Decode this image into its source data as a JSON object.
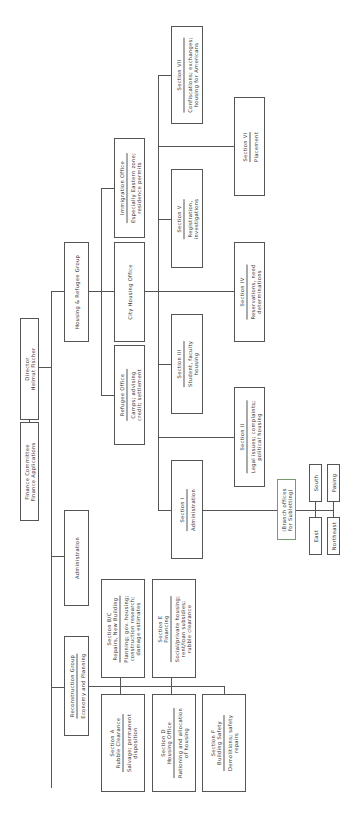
{
  "diagram": {
    "type": "org-chart",
    "orientation": "rotated-90-ccw",
    "nodes": {
      "director": {
        "title": "Director",
        "subtitle": "Helmut Fischer"
      },
      "finance": {
        "title": "Finance Committee",
        "subtitle": "Finance Applications"
      },
      "housing_group": {
        "title": "Housing & Refugee Group"
      },
      "administration": {
        "title": "Administration"
      },
      "reconstruction": {
        "title": "Reconstruction Group",
        "subtitle": "Economy and Planning"
      },
      "immigration": {
        "title": "Immigration Office",
        "desc1": "Especially Eastern zone;",
        "desc2": "residence permits"
      },
      "city_housing": {
        "title": "City Housing Office"
      },
      "refugee": {
        "title": "Refugee Office",
        "desc1": "Camps; advising",
        "desc2": "credit; settlement"
      },
      "sec7": {
        "title": "Section VII",
        "desc1": "Confiscations; exchanges;",
        "desc2": "housing for Americans"
      },
      "sec6": {
        "title": "Section VI",
        "desc1": "Placement"
      },
      "sec5": {
        "title": "Section V",
        "desc1": "Registration,",
        "desc2": "investigations"
      },
      "sec4": {
        "title": "Section IV",
        "desc1": "Reservations, need",
        "desc2": "determinations"
      },
      "sec3": {
        "title": "Section III",
        "desc1": "Student, faculty",
        "desc2": "housing"
      },
      "sec2": {
        "title": "Section II",
        "desc1": "Legal issues; complaints;",
        "desc2": "political housing"
      },
      "sec1": {
        "title": "Section I",
        "desc1": "Administration"
      },
      "branch": {
        "line1": "(Branch offices",
        "line2": "for Subletting)"
      },
      "south": {
        "title": "South"
      },
      "pasing": {
        "title": "Pasing"
      },
      "east": {
        "title": "East"
      },
      "northeast": {
        "title": "Northeast"
      },
      "secbc": {
        "title": "Section B/C",
        "title2": "Repairs, New Building",
        "desc1": "Planning; gov. housing;",
        "desc2": "construction research;",
        "desc3": "damage estimates"
      },
      "sece": {
        "title": "Section E",
        "title2": "Financing",
        "desc1": "Social/private housing;",
        "desc2": "rent/loan subsidies;",
        "desc3": "rubble clearance"
      },
      "seca": {
        "title": "Section A",
        "title2": "Rubble Clearance",
        "desc1": "Salvage; permanent",
        "desc2": "disposition"
      },
      "secd": {
        "title": "Section D",
        "title2": "Housing Office",
        "desc1": "Rationing and allocation",
        "desc2": "of housing"
      },
      "secf": {
        "title": "Section F",
        "title2": "Building Safety",
        "desc1": "Demolitions; safety",
        "desc2": "repairs"
      }
    }
  }
}
